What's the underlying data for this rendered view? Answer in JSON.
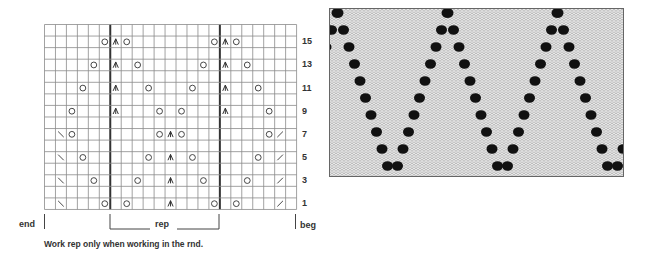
{
  "chart": {
    "columns": 23,
    "rows": 16,
    "cell_width": 10.96,
    "cell_height": 11.56,
    "repeat_start_col": 7,
    "repeat_end_col": 16,
    "row_labels": [
      "15",
      "13",
      "11",
      "9",
      "7",
      "5",
      "3",
      "1"
    ],
    "symbol_legend": {
      "O": "yarn-over",
      "A": "centered-double-decrease",
      "L": "left-slanting-decrease",
      "R": "right-slanting-decrease"
    },
    "row_symbols": {
      "15": [
        [
          6,
          "O"
        ],
        [
          7,
          "A"
        ],
        [
          8,
          "O"
        ],
        [
          16,
          "O"
        ],
        [
          17,
          "A"
        ],
        [
          18,
          "O"
        ]
      ],
      "13": [
        [
          5,
          "O"
        ],
        [
          7,
          "A"
        ],
        [
          9,
          "O"
        ],
        [
          15,
          "O"
        ],
        [
          17,
          "A"
        ],
        [
          19,
          "O"
        ]
      ],
      "11": [
        [
          4,
          "O"
        ],
        [
          7,
          "A"
        ],
        [
          10,
          "O"
        ],
        [
          14,
          "O"
        ],
        [
          17,
          "A"
        ],
        [
          20,
          "O"
        ]
      ],
      "9": [
        [
          3,
          "O"
        ],
        [
          7,
          "A"
        ],
        [
          11,
          "O"
        ],
        [
          13,
          "O"
        ],
        [
          17,
          "A"
        ],
        [
          21,
          "O"
        ]
      ],
      "7": [
        [
          2,
          "L"
        ],
        [
          3,
          "O"
        ],
        [
          11,
          "O"
        ],
        [
          12,
          "A"
        ],
        [
          13,
          "O"
        ],
        [
          21,
          "O"
        ],
        [
          22,
          "R"
        ]
      ],
      "5": [
        [
          2,
          "L"
        ],
        [
          4,
          "O"
        ],
        [
          10,
          "O"
        ],
        [
          12,
          "A"
        ],
        [
          14,
          "O"
        ],
        [
          20,
          "O"
        ],
        [
          22,
          "R"
        ]
      ],
      "3": [
        [
          2,
          "L"
        ],
        [
          5,
          "O"
        ],
        [
          9,
          "O"
        ],
        [
          12,
          "A"
        ],
        [
          15,
          "O"
        ],
        [
          19,
          "O"
        ],
        [
          22,
          "R"
        ]
      ],
      "1": [
        [
          2,
          "L"
        ],
        [
          6,
          "O"
        ],
        [
          8,
          "O"
        ],
        [
          12,
          "A"
        ],
        [
          16,
          "O"
        ],
        [
          18,
          "O"
        ],
        [
          22,
          "R"
        ]
      ]
    },
    "colors": {
      "grid_line": "#8a8a8a",
      "thick_line": "#333333",
      "symbol": "#333333"
    }
  },
  "labels": {
    "end": "end",
    "rep": "rep",
    "beg": "beg",
    "note": "Work rep only when working in the rnd."
  },
  "photo": {
    "description": "knitted-lace-swatch",
    "colors": {
      "yarn": "#ececec",
      "holes": "#111111"
    }
  }
}
